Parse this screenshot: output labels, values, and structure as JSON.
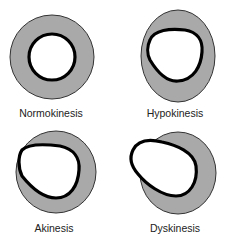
{
  "diagram": {
    "panels": [
      {
        "id": "normokinesis",
        "label": "Normokinesis"
      },
      {
        "id": "hypokinesis",
        "label": "Hypokinesis"
      },
      {
        "id": "akinesis",
        "label": "Akinesis"
      },
      {
        "id": "dyskinesis",
        "label": "Dyskinesis"
      }
    ],
    "colors": {
      "wall_fill": "#a9a9a9",
      "wall_stroke": "#333333",
      "endocardium_stroke": "#000000",
      "cavity_fill": "#ffffff"
    }
  }
}
